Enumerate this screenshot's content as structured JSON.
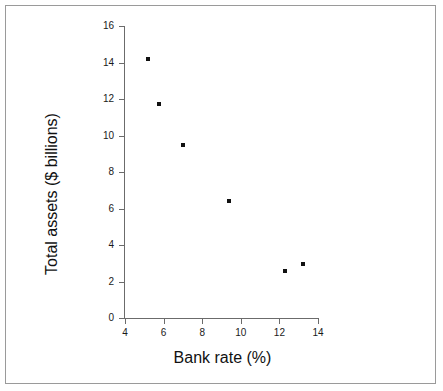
{
  "chart_data": {
    "type": "scatter",
    "title": "",
    "xlabel": "Bank rate (%)",
    "ylabel": "Total assets ($ billions)",
    "xlim": [
      4,
      14
    ],
    "ylim": [
      0,
      16
    ],
    "xticks": [
      4,
      6,
      8,
      10,
      12,
      14
    ],
    "yticks": [
      0,
      2,
      4,
      6,
      8,
      10,
      12,
      14,
      16
    ],
    "xtick_labels": [
      "4",
      "6",
      "8",
      "10",
      "12",
      "14"
    ],
    "ytick_labels": [
      "0",
      "2",
      "4",
      "6",
      "8",
      "10",
      "12",
      "14",
      "16"
    ],
    "grid": false,
    "legend": null,
    "marker": {
      "shape": "square",
      "color": "#111111",
      "size_px": 4
    },
    "points": [
      {
        "x": 5.2,
        "y": 14.2
      },
      {
        "x": 5.75,
        "y": 11.7
      },
      {
        "x": 7.0,
        "y": 9.5
      },
      {
        "x": 9.4,
        "y": 6.4
      },
      {
        "x": 12.3,
        "y": 2.6
      },
      {
        "x": 13.2,
        "y": 2.95
      }
    ],
    "x": [
      5.2,
      5.75,
      7.0,
      9.4,
      12.3,
      13.2
    ],
    "values": [
      14.2,
      11.7,
      9.5,
      6.4,
      2.6,
      2.95
    ]
  },
  "figure": {
    "border_color": "#9a9a9a",
    "axis_color": "#6b6b6b",
    "background": "#ffffff"
  }
}
